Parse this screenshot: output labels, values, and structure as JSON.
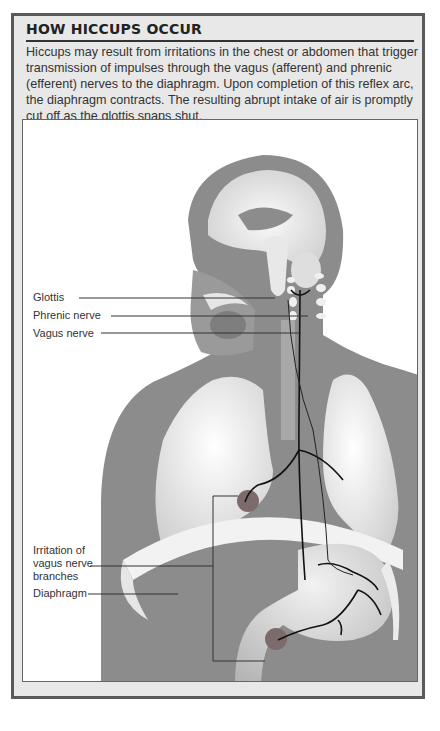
{
  "figure": {
    "title": "HOW HICCUPS OCCUR",
    "caption": "Hiccups may result from irritations in the chest or abdomen that trigger transmission of impulses through the vagus (afferent) and phrenic (efferent) nerves to the diaphragm. Upon completion of this reflex arc, the diaphragm contracts. The resulting abrupt intake of air is promptly cut off as the glottis snaps shut."
  },
  "labels": {
    "glottis": "Glottis",
    "phrenic": "Phrenic nerve",
    "vagus": "Vagus nerve",
    "irritation_1": "Irritation of",
    "irritation_2": "vagus nerve",
    "irritation_3": "branches",
    "diaphragm": "Diaphragm"
  },
  "colors": {
    "body": "#8a8a8a",
    "organ_light": "#ececec",
    "irritation_spot": "#7d6a6a",
    "nerve": "#111111"
  }
}
